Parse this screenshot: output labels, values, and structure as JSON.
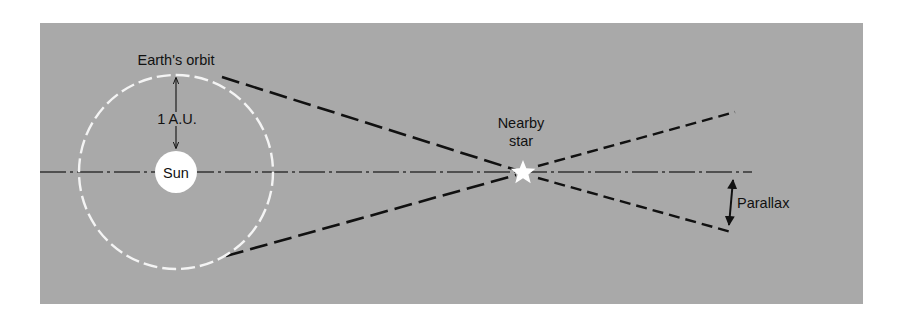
{
  "diagram": {
    "type": "stellar-parallax",
    "colors": {
      "background": "#a9a9a9",
      "page": "#ffffff",
      "lines": "#111111",
      "orbit": "#f4f4f4",
      "sun": "#ffffff",
      "star": "#ffffff"
    },
    "labels": {
      "orbit": "Earth's orbit",
      "distance": "1 A.U.",
      "sun": "Sun",
      "star_line1": "Nearby",
      "star_line2": "star",
      "parallax": "Parallax"
    },
    "elements": {
      "sun": {
        "cx": 176,
        "cy": 172,
        "r": 21
      },
      "orbit": {
        "cx": 176,
        "cy": 172,
        "r": 98
      },
      "star": {
        "cx": 523,
        "cy": 172
      },
      "axis": {
        "x1": 40,
        "x2": 752,
        "y": 172
      },
      "sight_line_upper": {
        "x1": 222,
        "y1": 77,
        "x2": 523,
        "y2": 172,
        "x3": 735,
        "y3": 112
      },
      "sight_line_lower": {
        "x1": 226,
        "y1": 256,
        "x2": 523,
        "y2": 172,
        "x3": 731,
        "y3": 232
      },
      "parallax_arrow": {
        "x1": 734,
        "y1": 173,
        "x2": 728,
        "y2": 232
      }
    }
  }
}
